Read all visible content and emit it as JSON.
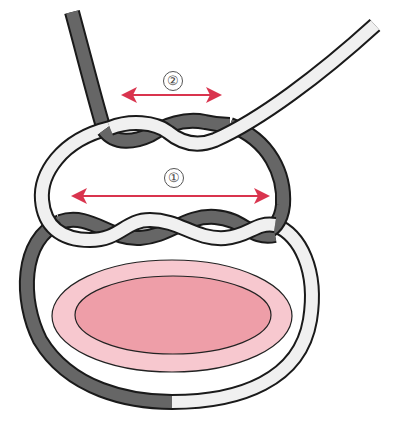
{
  "diagram": {
    "type": "knot-illustration",
    "labels": [
      {
        "id": "1",
        "text": "①",
        "x": 173,
        "y": 178
      },
      {
        "id": "2",
        "text": "②",
        "x": 172,
        "y": 80
      }
    ],
    "arrows": [
      {
        "label": "2",
        "x1": 123,
        "x2": 220,
        "y": 95
      },
      {
        "label": "1",
        "x1": 73,
        "x2": 268,
        "y": 196
      }
    ],
    "colors": {
      "dark_rope": "#666666",
      "light_rope": "#f0f0f0",
      "outline": "#1a1a1a",
      "arrow": "#d9344e",
      "oval_outer": "#f7c8cf",
      "oval_inner": "#ee9ea8"
    }
  }
}
